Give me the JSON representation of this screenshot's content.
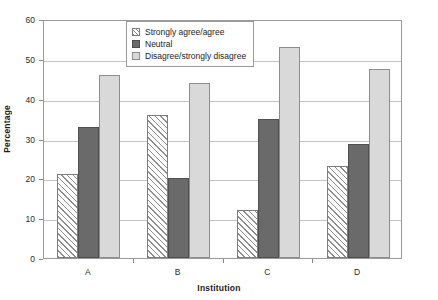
{
  "chart_data": {
    "type": "bar",
    "title": "",
    "xlabel": "Institution",
    "ylabel": "Percentage",
    "categories": [
      "A",
      "B",
      "C",
      "D"
    ],
    "series": [
      {
        "name": "Strongly agree/agree",
        "values": [
          21,
          36,
          12,
          23
        ],
        "color": "#ffffff",
        "pattern": "diagonal-hatch"
      },
      {
        "name": "Neutral",
        "values": [
          33,
          20,
          35,
          28.5
        ],
        "color": "#6a6a6a",
        "pattern": "solid"
      },
      {
        "name": "Disagree/strongly disagree",
        "values": [
          46,
          44,
          53,
          47.5
        ],
        "color": "#d9d9d9",
        "pattern": "solid"
      }
    ],
    "ylim": [
      0,
      60
    ],
    "yticks": [
      0,
      10,
      20,
      30,
      40,
      50,
      60
    ],
    "ytick_labels": [
      "0",
      "10",
      "20",
      "30",
      "40",
      "50",
      "60"
    ],
    "grid": "horizontal",
    "legend_position": "top-center",
    "legend_entries": [
      "Strongly agree/agree",
      "Neutral",
      "Disagree/strongly disagree"
    ]
  }
}
